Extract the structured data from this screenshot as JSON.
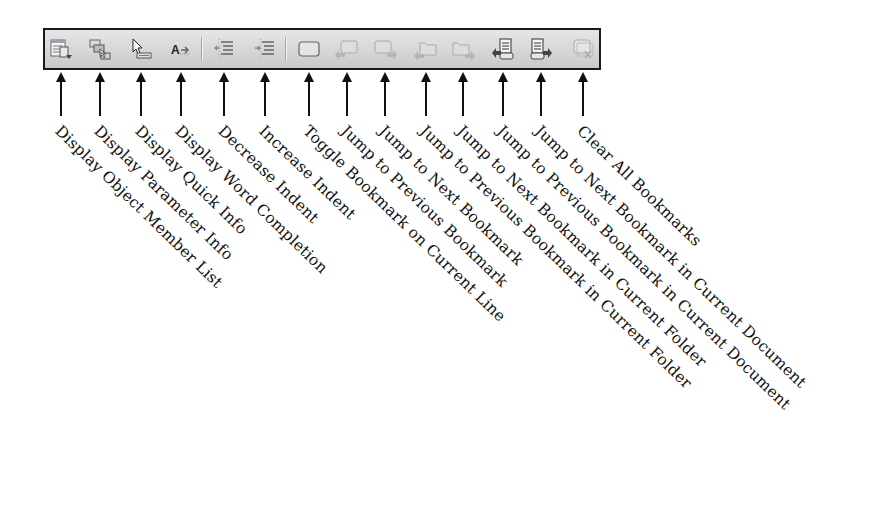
{
  "toolbar": {
    "buttons": [
      {
        "icon": "object-member-list-icon",
        "label": "Display Object Member List",
        "x": 61,
        "enabled": true
      },
      {
        "icon": "parameter-info-icon",
        "label": "Display Parameter Info",
        "x": 100,
        "enabled": true
      },
      {
        "icon": "quick-info-icon",
        "label": "Display Quick Info",
        "x": 141,
        "enabled": true
      },
      {
        "icon": "word-completion-icon",
        "label": "Display Word Completion",
        "x": 181,
        "enabled": true
      },
      {
        "icon": "decrease-indent-icon",
        "label": "Decrease Indent",
        "x": 224,
        "enabled": true
      },
      {
        "icon": "increase-indent-icon",
        "label": "Increase Indent",
        "x": 265,
        "enabled": true
      },
      {
        "icon": "toggle-bookmark-icon",
        "label": "Toggle Bookmark on Current Line",
        "x": 309,
        "enabled": true
      },
      {
        "icon": "previous-bookmark-icon",
        "label": "Jump to Previous Bookmark",
        "x": 347,
        "enabled": false
      },
      {
        "icon": "next-bookmark-icon",
        "label": "Jump to Next Bookmark",
        "x": 385,
        "enabled": false
      },
      {
        "icon": "previous-bookmark-folder-icon",
        "label": "Jump to Previous Bookmark in Current Folder",
        "x": 426,
        "enabled": false
      },
      {
        "icon": "next-bookmark-folder-icon",
        "label": "Jump to Next Bookmark in Current Folder",
        "x": 463,
        "enabled": false
      },
      {
        "icon": "previous-bookmark-document-icon",
        "label": "Jump to Previous Bookmark in Current Document",
        "x": 503,
        "enabled": true
      },
      {
        "icon": "next-bookmark-document-icon",
        "label": "Jump to Next Bookmark in Current Document",
        "x": 541,
        "enabled": true
      },
      {
        "icon": "clear-bookmarks-icon",
        "label": "Clear All Bookmarks",
        "x": 583,
        "enabled": false
      }
    ]
  },
  "labels": [
    "Display Object Member List",
    "Display Parameter Info",
    "Display Quick Info",
    "Display Word Completion",
    "Decrease Indent",
    "Increase Indent",
    "Toggle Bookmark on Current Line",
    "Jump to Previous Bookmark",
    "Jump to Next Bookmark",
    "Jump to Previous Bookmark in Current Folder",
    "Jump to Next Bookmark in Current Folder",
    "Jump to Previous Bookmark in Current Document",
    "Jump to Next Bookmark in Current Document",
    "Clear All Bookmarks"
  ]
}
